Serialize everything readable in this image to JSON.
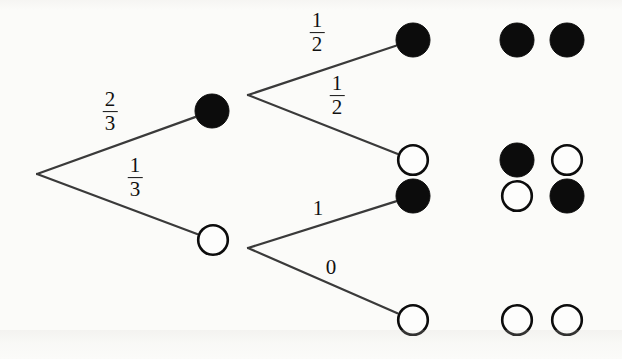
{
  "figure": {
    "width": 622,
    "height": 359,
    "background_color": "#fbfbf9",
    "ink_color": "#111111",
    "line_color": "#3a3a3a"
  },
  "nodes": {
    "root": {
      "name": "root-fork",
      "x": 37,
      "y": 174,
      "type": "fork",
      "radius": 0
    },
    "level1": [
      {
        "name": "node-black-upper",
        "x": 212,
        "y": 111,
        "fill": "black",
        "radius": 17
      },
      {
        "name": "node-white-lower",
        "x": 213,
        "y": 240,
        "fill": "white",
        "radius": 16
      }
    ],
    "level1_forks": [
      {
        "name": "fork-upper",
        "x": 248,
        "y": 95
      },
      {
        "name": "fork-lower",
        "x": 248,
        "y": 248
      }
    ],
    "leaves": [
      {
        "name": "leaf-1",
        "x": 413,
        "y": 40,
        "fill": "black",
        "radius": 17
      },
      {
        "name": "leaf-2",
        "x": 413,
        "y": 160,
        "fill": "white",
        "radius": 16
      },
      {
        "name": "leaf-3",
        "x": 413,
        "y": 196,
        "fill": "black",
        "radius": 17
      },
      {
        "name": "leaf-4",
        "x": 413,
        "y": 320,
        "fill": "white",
        "radius": 16
      }
    ]
  },
  "edges": [
    {
      "name": "edge-root-to-black",
      "from": "root",
      "to": "node-black-upper",
      "label": "2/3",
      "numerator": "2",
      "denominator": "3",
      "kind": "fraction"
    },
    {
      "name": "edge-root-to-white",
      "from": "root",
      "to": "node-white-lower",
      "label": "1/3",
      "numerator": "1",
      "denominator": "3",
      "kind": "fraction"
    },
    {
      "name": "edge-black-to-black",
      "from": "fork-upper",
      "to": "leaf-1",
      "label": "1/2",
      "numerator": "1",
      "denominator": "2",
      "kind": "fraction"
    },
    {
      "name": "edge-black-to-white",
      "from": "fork-upper",
      "to": "leaf-2",
      "label": "1/2",
      "numerator": "1",
      "denominator": "2",
      "kind": "fraction"
    },
    {
      "name": "edge-white-to-black",
      "from": "fork-lower",
      "to": "leaf-3",
      "label": "1",
      "kind": "integer"
    },
    {
      "name": "edge-white-to-white",
      "from": "fork-lower",
      "to": "leaf-4",
      "label": "0",
      "kind": "integer"
    }
  ],
  "edge_labels": [
    {
      "name": "edge-label-two-thirds",
      "x": 110,
      "y": 112,
      "numerator": "2",
      "denominator": "3",
      "kind": "fraction"
    },
    {
      "name": "edge-label-one-third",
      "x": 135,
      "y": 178,
      "numerator": "1",
      "denominator": "3",
      "kind": "fraction"
    },
    {
      "name": "edge-label-one-half-upper",
      "x": 317,
      "y": 33,
      "numerator": "1",
      "denominator": "2",
      "kind": "fraction"
    },
    {
      "name": "edge-label-one-half-lower",
      "x": 337,
      "y": 96,
      "numerator": "1",
      "denominator": "2",
      "kind": "fraction"
    },
    {
      "name": "edge-label-one",
      "x": 318,
      "y": 208,
      "value": "1",
      "kind": "integer"
    },
    {
      "name": "edge-label-zero",
      "x": 331,
      "y": 267,
      "value": "0",
      "kind": "integer"
    }
  ],
  "outcomes": [
    {
      "name": "outcome-black-black",
      "row_y": 40,
      "balls": [
        {
          "name": "outcome-ball-left",
          "x": 517,
          "y": 40,
          "fill": "black",
          "radius": 17
        },
        {
          "name": "outcome-ball-right",
          "x": 567,
          "y": 40,
          "fill": "black",
          "radius": 17
        }
      ]
    },
    {
      "name": "outcome-black-white",
      "row_y": 160,
      "balls": [
        {
          "name": "outcome-ball-left",
          "x": 517,
          "y": 160,
          "fill": "black",
          "radius": 17
        },
        {
          "name": "outcome-ball-right",
          "x": 567,
          "y": 160,
          "fill": "white",
          "radius": 16
        }
      ]
    },
    {
      "name": "outcome-white-black",
      "row_y": 196,
      "balls": [
        {
          "name": "outcome-ball-left",
          "x": 517,
          "y": 196,
          "fill": "white",
          "radius": 16
        },
        {
          "name": "outcome-ball-right",
          "x": 567,
          "y": 196,
          "fill": "black",
          "radius": 17
        }
      ]
    },
    {
      "name": "outcome-white-white",
      "row_y": 320,
      "balls": [
        {
          "name": "outcome-ball-left",
          "x": 517,
          "y": 320,
          "fill": "white",
          "radius": 16
        },
        {
          "name": "outcome-ball-right",
          "x": 567,
          "y": 320,
          "fill": "white",
          "radius": 16
        }
      ]
    }
  ]
}
